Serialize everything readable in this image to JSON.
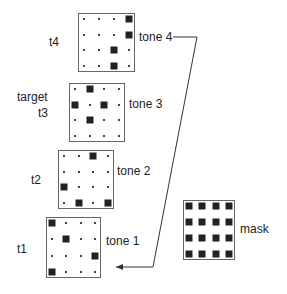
{
  "labels": {
    "target": "target",
    "mask": "mask"
  },
  "tones": [
    {
      "id": "t4",
      "time_label": "t4",
      "tone_label": "tone 4",
      "box": {
        "x": 78,
        "y": 13,
        "w": 57,
        "h": 59
      },
      "pattern": [
        [
          0,
          0,
          0,
          1
        ],
        [
          0,
          0,
          0,
          1
        ],
        [
          0,
          0,
          1,
          0
        ],
        [
          0,
          0,
          1,
          0
        ]
      ]
    },
    {
      "id": "t3",
      "time_label": "t3",
      "tone_label": "tone 3",
      "box": {
        "x": 69,
        "y": 83,
        "w": 56,
        "h": 59
      },
      "pattern": [
        [
          0,
          1,
          0,
          0
        ],
        [
          1,
          0,
          1,
          0
        ],
        [
          0,
          1,
          0,
          0
        ],
        [
          0,
          0,
          0,
          0
        ]
      ]
    },
    {
      "id": "t2",
      "time_label": "t2",
      "tone_label": "tone 2",
      "box": {
        "x": 58,
        "y": 150,
        "w": 56,
        "h": 59
      },
      "pattern": [
        [
          0,
          0,
          1,
          0
        ],
        [
          0,
          0,
          0,
          0
        ],
        [
          1,
          0,
          0,
          0
        ],
        [
          0,
          1,
          0,
          1
        ]
      ]
    },
    {
      "id": "t1",
      "time_label": "t1",
      "tone_label": "tone 1",
      "box": {
        "x": 46,
        "y": 217,
        "w": 55,
        "h": 61
      },
      "pattern": [
        [
          1,
          0,
          0,
          0
        ],
        [
          0,
          1,
          0,
          0
        ],
        [
          0,
          0,
          0,
          1
        ],
        [
          1,
          0,
          0,
          0
        ]
      ]
    }
  ],
  "mask": {
    "box": {
      "x": 183,
      "y": 200,
      "w": 52,
      "h": 60
    },
    "pattern": [
      [
        1,
        1,
        1,
        1
      ],
      [
        1,
        1,
        1,
        1
      ],
      [
        1,
        1,
        1,
        1
      ],
      [
        1,
        1,
        1,
        1
      ]
    ]
  },
  "arrow": {
    "from": "tone 4",
    "to": "tone 1",
    "points": [
      [
        173,
        37
      ],
      [
        197,
        37
      ],
      [
        153,
        267
      ],
      [
        116,
        267
      ]
    ]
  }
}
